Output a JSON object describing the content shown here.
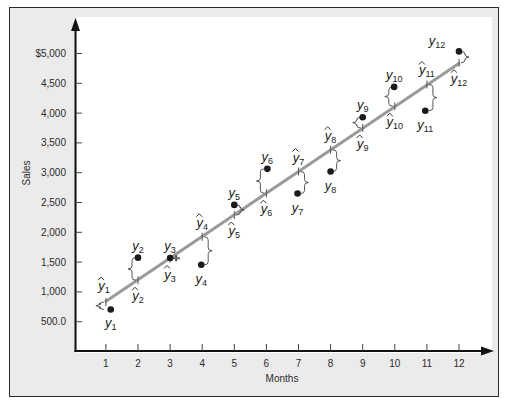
{
  "chart_data": {
    "type": "scatter",
    "title": "",
    "xlabel": "Months",
    "ylabel": "Sales",
    "x_ticks": [
      "1",
      "2",
      "3",
      "4",
      "5",
      "6",
      "7",
      "8",
      "9",
      "10",
      "11",
      "12"
    ],
    "y_ticks": [
      {
        "value": 500,
        "label": "500.0"
      },
      {
        "value": 1000,
        "label": "1,000"
      },
      {
        "value": 1500,
        "label": "1,500"
      },
      {
        "value": 2000,
        "label": "2,000"
      },
      {
        "value": 2500,
        "label": "2,500"
      },
      {
        "value": 3000,
        "label": "3,000"
      },
      {
        "value": 3500,
        "label": "3,500"
      },
      {
        "value": 4000,
        "label": "4,000"
      },
      {
        "value": 4500,
        "label": "4,500"
      },
      {
        "value": 5000,
        "label": "$5,000"
      }
    ],
    "xlim": [
      0,
      12.9
    ],
    "ylim": [
      0,
      5500
    ],
    "grid": false,
    "legend": null,
    "series": [
      {
        "name": "Actual sales (y)",
        "type": "scatter",
        "x": [
          1.15,
          2,
          3,
          3.97,
          5,
          6.03,
          6.97,
          8,
          9,
          9.98,
          10.95,
          12
        ],
        "values": [
          705,
          1575,
          1570,
          1455,
          2460,
          3065,
          2650,
          3020,
          3930,
          4440,
          4040,
          5035
        ],
        "labels": [
          "y1",
          "y2",
          "y3",
          "y4",
          "y5",
          "y6",
          "y7",
          "y8",
          "y9",
          "y10",
          "y11",
          "y12"
        ]
      },
      {
        "name": "Trend line (ŷ)",
        "type": "line",
        "x": [
          1,
          2,
          3,
          4,
          5,
          6,
          7,
          8,
          9,
          10,
          11,
          12
        ],
        "values": [
          830,
          1195,
          1560,
          1925,
          2290,
          2655,
          3020,
          3385,
          3750,
          4115,
          4480,
          4845
        ],
        "labels": [
          "ŷ1",
          "ŷ2",
          "ŷ3",
          "ŷ4",
          "ŷ5",
          "ŷ6",
          "ŷ7",
          "ŷ8",
          "ŷ9",
          "ŷ10",
          "ŷ11",
          "ŷ12"
        ]
      }
    ],
    "annotations": [
      {
        "text": "y1",
        "at": "point 1 actual",
        "position": "below"
      },
      {
        "text": "ŷ1",
        "at": "point 1 trend",
        "position": "above"
      },
      {
        "text": "y2",
        "position": "above"
      },
      {
        "text": "ŷ2",
        "position": "below"
      },
      {
        "text": "y3",
        "position": "above"
      },
      {
        "text": "ŷ3",
        "position": "below"
      },
      {
        "text": "y4",
        "position": "below"
      },
      {
        "text": "ŷ4",
        "position": "above"
      },
      {
        "text": "y5",
        "position": "above"
      },
      {
        "text": "ŷ5",
        "position": "below"
      },
      {
        "text": "y6",
        "position": "above"
      },
      {
        "text": "ŷ6",
        "position": "below"
      },
      {
        "text": "y7",
        "position": "below"
      },
      {
        "text": "ŷ7",
        "position": "above"
      },
      {
        "text": "y8",
        "position": "below"
      },
      {
        "text": "ŷ8",
        "position": "above"
      },
      {
        "text": "y9",
        "position": "above"
      },
      {
        "text": "ŷ9",
        "position": "below"
      },
      {
        "text": "y10",
        "position": "above"
      },
      {
        "text": "ŷ10",
        "position": "below"
      },
      {
        "text": "y11",
        "position": "below"
      },
      {
        "text": "ŷ11",
        "position": "above"
      },
      {
        "text": "y12",
        "position": "left"
      },
      {
        "text": "ŷ12",
        "position": "below"
      }
    ],
    "colors": {
      "trend_line": "#9a9a9a",
      "points": "#1a1a1a",
      "axes": "#111111",
      "frame_bg": "#ebebeb",
      "plot_bg": "#ffffff"
    }
  },
  "label_positions": [
    {
      "y": "below",
      "yhat": "above"
    },
    {
      "y": "above",
      "yhat": "below"
    },
    {
      "y": "above",
      "yhat": "below"
    },
    {
      "y": "below",
      "yhat": "above"
    },
    {
      "y": "above",
      "yhat": "below"
    },
    {
      "y": "above",
      "yhat": "below"
    },
    {
      "y": "below",
      "yhat": "above"
    },
    {
      "y": "below",
      "yhat": "above"
    },
    {
      "y": "above",
      "yhat": "below"
    },
    {
      "y": "above",
      "yhat": "below"
    },
    {
      "y": "below",
      "yhat": "above"
    },
    {
      "y": "left",
      "yhat": "below"
    }
  ]
}
